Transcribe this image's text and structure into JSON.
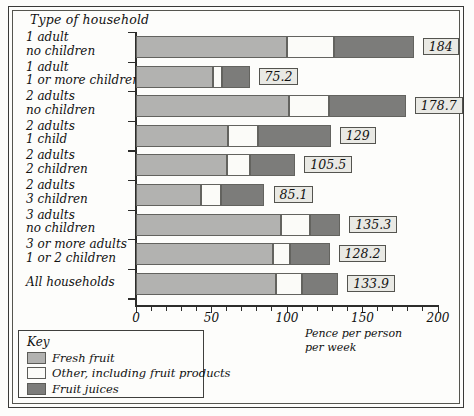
{
  "chart_title": "Type of household",
  "axis": {
    "xlabel_line1": "Pence per person",
    "xlabel_line2": "per week",
    "ticks": [
      0,
      50,
      100,
      150,
      200
    ],
    "xmin": 0,
    "xmax": 200,
    "tick_step_minor": 10
  },
  "legend": {
    "title": "Key",
    "items": [
      {
        "label": "Fresh fruit",
        "color": "#b2b2b0",
        "key": "fresh"
      },
      {
        "label": "Other, including fruit products",
        "color": "#fbfbf8",
        "key": "other"
      },
      {
        "label": "Fruit juices",
        "color": "#7c7c7a",
        "key": "juices"
      }
    ]
  },
  "chart_data": {
    "type": "bar",
    "orientation": "horizontal",
    "stacked": true,
    "title": "Type of household",
    "xlabel": "Pence per person per week",
    "ylabel": "Type of household",
    "xlim": [
      0,
      200
    ],
    "grid": false,
    "legend_position": "bottom-left",
    "categories": [
      "1 adult\nno children",
      "1 adult\n1 or more children",
      "2 adults\nno children",
      "2 adults\n1 child",
      "2 adults\n2 children",
      "2 adults\n3 children",
      "3 adults\nno children",
      "3 or more adults\n1 or 2 children",
      "All households"
    ],
    "series": [
      {
        "name": "Fresh fruit",
        "values": [
          100.0,
          51.0,
          101.0,
          61.0,
          60.0,
          43.0,
          96.0,
          91.0,
          93.0
        ]
      },
      {
        "name": "Other, including fruit products",
        "values": [
          31.0,
          6.2,
          26.7,
          20.0,
          15.5,
          13.1,
          19.3,
          11.2,
          16.9
        ]
      },
      {
        "name": "Fruit juices",
        "values": [
          53.0,
          18.0,
          51.0,
          48.0,
          30.0,
          29.0,
          20.0,
          26.0,
          24.0
        ]
      }
    ],
    "totals": [
      184,
      75.2,
      178.7,
      129,
      105.5,
      85.1,
      135.3,
      128.2,
      133.9
    ],
    "total_labels": [
      "184",
      "75.2",
      "178.7",
      "129",
      "105.5",
      "85.1",
      "135.3",
      "128.2",
      "133.9"
    ]
  },
  "rows": [
    {
      "line1": "1 adult",
      "line2": "no children",
      "label": "184"
    },
    {
      "line1": "1 adult",
      "line2": "1 or more children",
      "label": "75.2"
    },
    {
      "line1": "2 adults",
      "line2": "no children",
      "label": "178.7"
    },
    {
      "line1": "2 adults",
      "line2": "1 child",
      "label": "129"
    },
    {
      "line1": "2 adults",
      "line2": "2 children",
      "label": "105.5"
    },
    {
      "line1": "2 adults",
      "line2": "3 children",
      "label": "85.1"
    },
    {
      "line1": "3 adults",
      "line2": "no children",
      "label": "135.3"
    },
    {
      "line1": "3 or more adults",
      "line2": "1 or 2 children",
      "label": "128.2"
    },
    {
      "line1": "All households",
      "line2": "",
      "label": "133.9"
    }
  ]
}
